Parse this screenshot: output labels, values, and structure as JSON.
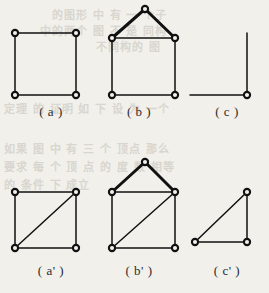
{
  "page": {
    "background_color": "#f1f0eb",
    "ink_color": "#1c1c1c",
    "width": 269,
    "height": 293,
    "kind": "scanned-book-figure-page"
  },
  "bleed_through_text": [
    {
      "text": "的图形 中 有 一 个子",
      "x": 52,
      "y": 6,
      "size": 11
    },
    {
      "text": "中的两个 图 不 是 同构",
      "x": 40,
      "y": 22,
      "size": 11
    },
    {
      "text": "不同构的 图",
      "x": 96,
      "y": 38,
      "size": 11
    },
    {
      "text": "定理 的 证明 如 下 设 为 一个",
      "x": 4,
      "y": 100,
      "size": 11
    },
    {
      "text": "如果 图 中 有 三 个 顶点 那么",
      "x": 4,
      "y": 140,
      "size": 11
    },
    {
      "text": "要求 每 个 顶 点 的 度 数 相等",
      "x": 4,
      "y": 158,
      "size": 11
    },
    {
      "text": "的 条件 下 成立",
      "x": 4,
      "y": 176,
      "size": 11
    }
  ],
  "figures": [
    {
      "id": "fig-a",
      "caption": "( a )",
      "caption_x": 16,
      "caption_y": 104,
      "description": "square graph with four vertices",
      "vertices": [
        {
          "name": "top-left",
          "x": 15,
          "y": 33
        },
        {
          "name": "top-right",
          "x": 76,
          "y": 33
        },
        {
          "name": "bottom-left",
          "x": 15,
          "y": 95
        },
        {
          "name": "bottom-right",
          "x": 76,
          "y": 95
        }
      ],
      "edges": [
        {
          "from": 0,
          "to": 1,
          "weight": "thin"
        },
        {
          "from": 1,
          "to": 3,
          "weight": "thin"
        },
        {
          "from": 3,
          "to": 2,
          "weight": "thin"
        },
        {
          "from": 2,
          "to": 0,
          "weight": "thin"
        }
      ]
    },
    {
      "id": "fig-b",
      "caption": "( b )",
      "caption_x": 104,
      "caption_y": 104,
      "description": "house graph: square with triangular roof apex",
      "vertices": [
        {
          "name": "apex",
          "x": 145,
          "y": 9
        },
        {
          "name": "top-left",
          "x": 112,
          "y": 38
        },
        {
          "name": "top-right",
          "x": 175,
          "y": 38
        },
        {
          "name": "bottom-left",
          "x": 112,
          "y": 95
        },
        {
          "name": "bottom-right",
          "x": 175,
          "y": 95
        }
      ],
      "edges": [
        {
          "from": 0,
          "to": 1,
          "weight": "thick"
        },
        {
          "from": 0,
          "to": 2,
          "weight": "thick"
        },
        {
          "from": 1,
          "to": 2,
          "weight": "thin"
        },
        {
          "from": 1,
          "to": 3,
          "weight": "thin"
        },
        {
          "from": 2,
          "to": 4,
          "weight": "thin"
        },
        {
          "from": 3,
          "to": 4,
          "weight": "thin"
        }
      ]
    },
    {
      "id": "fig-c",
      "caption": "( c )",
      "caption_x": 192,
      "caption_y": 104,
      "description": "right-angle corner: one vertex with a vertical and a horizontal ray",
      "vertices": [
        {
          "name": "corner",
          "x": 247,
          "y": 95
        }
      ],
      "rays": [
        {
          "name": "vertical-ray",
          "x1": 247,
          "y1": 33,
          "x2": 247,
          "y2": 95
        },
        {
          "name": "horizontal-ray",
          "x1": 190,
          "y1": 95,
          "x2": 247,
          "y2": 95
        }
      ]
    },
    {
      "id": "fig-a-prime",
      "caption": "( a' )",
      "caption_x": 16,
      "caption_y": 263,
      "description": "square graph with diagonal from bottom-left to top-right",
      "vertices": [
        {
          "name": "top-left",
          "x": 15,
          "y": 192
        },
        {
          "name": "top-right",
          "x": 76,
          "y": 192
        },
        {
          "name": "bottom-left",
          "x": 15,
          "y": 248
        },
        {
          "name": "bottom-right",
          "x": 76,
          "y": 248
        }
      ],
      "edges": [
        {
          "from": 0,
          "to": 1,
          "weight": "thin"
        },
        {
          "from": 1,
          "to": 3,
          "weight": "thin"
        },
        {
          "from": 3,
          "to": 2,
          "weight": "thin"
        },
        {
          "from": 2,
          "to": 0,
          "weight": "thin"
        },
        {
          "from": 2,
          "to": 1,
          "weight": "thin"
        }
      ]
    },
    {
      "id": "fig-b-prime",
      "caption": "( b' )",
      "caption_x": 104,
      "caption_y": 263,
      "description": "house graph with diagonal from bottom-left to top-right",
      "vertices": [
        {
          "name": "apex",
          "x": 145,
          "y": 162
        },
        {
          "name": "top-left",
          "x": 112,
          "y": 192
        },
        {
          "name": "top-right",
          "x": 175,
          "y": 192
        },
        {
          "name": "bottom-left",
          "x": 112,
          "y": 248
        },
        {
          "name": "bottom-right",
          "x": 175,
          "y": 248
        }
      ],
      "edges": [
        {
          "from": 0,
          "to": 1,
          "weight": "thick"
        },
        {
          "from": 0,
          "to": 2,
          "weight": "thick"
        },
        {
          "from": 1,
          "to": 2,
          "weight": "thin"
        },
        {
          "from": 1,
          "to": 3,
          "weight": "thin"
        },
        {
          "from": 2,
          "to": 4,
          "weight": "thin"
        },
        {
          "from": 3,
          "to": 4,
          "weight": "thin"
        },
        {
          "from": 3,
          "to": 2,
          "weight": "thin"
        }
      ]
    },
    {
      "id": "fig-c-prime",
      "caption": "( c' )",
      "caption_x": 192,
      "caption_y": 263,
      "description": "right triangle with three vertices",
      "vertices": [
        {
          "name": "top-right",
          "x": 247,
          "y": 192
        },
        {
          "name": "bottom-left",
          "x": 195,
          "y": 242
        },
        {
          "name": "bottom-right",
          "x": 247,
          "y": 242
        }
      ],
      "edges": [
        {
          "from": 0,
          "to": 1,
          "weight": "thin"
        },
        {
          "from": 1,
          "to": 2,
          "weight": "thin"
        },
        {
          "from": 2,
          "to": 0,
          "weight": "thin"
        }
      ]
    }
  ],
  "style": {
    "vertex_radius": 3.1,
    "vertex_fill": "#f1f0eb",
    "vertex_stroke": "#111111",
    "vertex_stroke_width": 2.1,
    "edge_thin_width": 1.5,
    "edge_thick_width": 3.0
  }
}
